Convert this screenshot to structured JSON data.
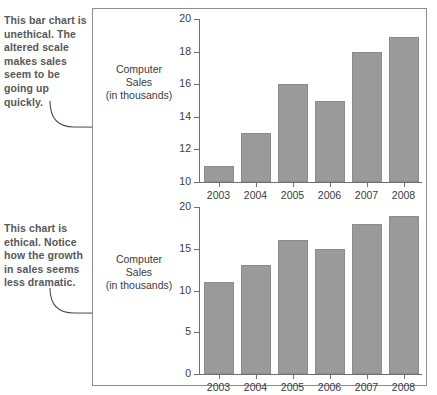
{
  "callouts": {
    "top": "This bar chart is unethical. The altered scale makes sales seem to be going up quickly.",
    "bottom": "This chart is ethical. Notice how the growth in sales seems less dramatic."
  },
  "axis_caption": {
    "line1": "Computer",
    "line2": "Sales",
    "line3": "(in thousands)"
  },
  "colors": {
    "bar_fill": "#9a9a9a",
    "bar_stroke": "#8c8c8c",
    "axis": "#6f6f6f",
    "frame": "#8d8d8d",
    "callout_text": "#58585a",
    "label_text": "#3b3b3d"
  },
  "chart_data": [
    {
      "type": "bar",
      "id": "unethical-truncated-axis-chart",
      "title": "",
      "xlabel": "",
      "ylabel": "Computer Sales (in thousands)",
      "categories": [
        "2003",
        "2004",
        "2005",
        "2006",
        "2007",
        "2008"
      ],
      "values": [
        11,
        13,
        16,
        15,
        18,
        18.9
      ],
      "ylim": [
        10,
        20
      ],
      "yticks": [
        10,
        12,
        14,
        16,
        18,
        20
      ],
      "ytick_labels": [
        "10",
        "12",
        "14",
        "16",
        "18",
        "20"
      ],
      "grid": false,
      "legend": null,
      "annotation": "This bar chart is unethical. The altered scale makes sales seem to be going up quickly."
    },
    {
      "type": "bar",
      "id": "ethical-zero-baseline-chart",
      "title": "",
      "xlabel": "",
      "ylabel": "Computer Sales (in thousands)",
      "categories": [
        "2003",
        "2004",
        "2005",
        "2006",
        "2007",
        "2008"
      ],
      "values": [
        11,
        13,
        16,
        15,
        18,
        18.9
      ],
      "ylim": [
        0,
        20
      ],
      "yticks": [
        0,
        5,
        10,
        15,
        20
      ],
      "ytick_labels": [
        "0",
        "5",
        "10",
        "15",
        "20"
      ],
      "grid": false,
      "legend": null,
      "annotation": "This chart is ethical. Notice how the growth in sales seems less dramatic."
    }
  ]
}
